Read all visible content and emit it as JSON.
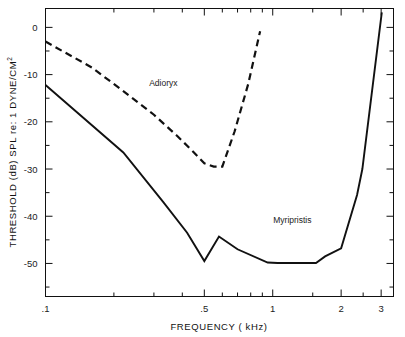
{
  "chart_data": {
    "type": "line",
    "title": "",
    "xlabel": "FREQUENCY ( kHz)",
    "ylabel": "THRESHOLD (dB) SPL re: 1 DYNE/CM",
    "ylabel_superscript": "2",
    "xscale": "log",
    "yscale": "linear",
    "xlim": [
      0.1,
      3.4
    ],
    "ylim": [
      -57,
      4
    ],
    "grid": false,
    "legend": "inline-annotations",
    "xtick_labels": [
      ".1",
      ".5",
      "1",
      "2",
      "3"
    ],
    "xtick_values": [
      0.1,
      0.5,
      1,
      2,
      3
    ],
    "xminor_values": [
      0.2,
      0.3,
      0.4,
      0.6,
      0.7,
      0.8,
      0.9,
      1.5,
      2.5
    ],
    "ytick_labels": [
      "0",
      "-10",
      "-20",
      "-30",
      "-40",
      "-50"
    ],
    "ytick_values": [
      0,
      -10,
      -20,
      -30,
      -40,
      -50
    ],
    "yminor_values": [
      -5,
      -15,
      -25,
      -35,
      -45,
      -55
    ],
    "series": [
      {
        "name": "Adioryx",
        "style": "dashed",
        "color": "#111111",
        "label_x": 0.33,
        "label_y": -12.5,
        "x": [
          0.1,
          0.16,
          0.22,
          0.3,
          0.38,
          0.45,
          0.5,
          0.55,
          0.6,
          0.68,
          0.78,
          0.88
        ],
        "y": [
          -3.0,
          -8.5,
          -13.5,
          -18.5,
          -23.0,
          -26.5,
          -28.8,
          -29.5,
          -29.5,
          -22.0,
          -12.0,
          -0.8
        ]
      },
      {
        "name": "Myripristis",
        "style": "solid",
        "color": "#111111",
        "label_x": 1.22,
        "label_y": -41.5,
        "x": [
          0.1,
          0.22,
          0.33,
          0.42,
          0.5,
          0.58,
          0.7,
          0.95,
          1.05,
          1.55,
          1.7,
          2.0,
          2.35,
          2.48,
          3.02
        ],
        "y": [
          -12.2,
          -26.5,
          -37.0,
          -43.5,
          -49.5,
          -44.3,
          -47.0,
          -49.8,
          -49.9,
          -49.9,
          -48.5,
          -46.8,
          -35.5,
          -30.0,
          3.2
        ]
      }
    ]
  },
  "axes": {
    "x_axis_name": "frequency-axis",
    "y_axis_name": "threshold-axis"
  }
}
